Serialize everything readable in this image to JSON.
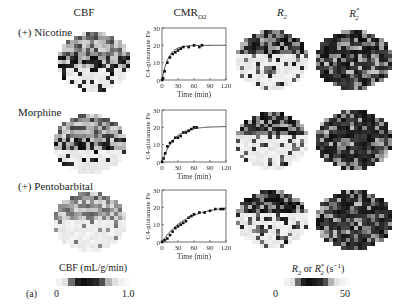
{
  "figure": {
    "panel_label": "(a)",
    "column_titles": {
      "cbf": "CBF",
      "cmro2_main": "CMR",
      "cmro2_sub": "O2",
      "r2_main": "R",
      "r2_sub": "2",
      "r2star_main": "R",
      "r2star_sub": "2",
      "r2star_sup": "*"
    },
    "rows": [
      {
        "label": "(+) Nicotine"
      },
      {
        "label": "Morphine"
      },
      {
        "label": "(+) Pentobarbital"
      }
    ],
    "plot_axis": {
      "ylabel": "C4-glutamate Fe",
      "xlabel": "Time (min)",
      "yticks": [
        "0",
        "10",
        "20",
        "30"
      ],
      "xticks": [
        "0",
        "30",
        "60",
        "90",
        "120"
      ]
    },
    "colorbars": {
      "cbf": {
        "title": "CBF (mL/g/min)",
        "min": "0",
        "max": "1.0"
      },
      "r2": {
        "title_main": "R",
        "title_sub": "2",
        "title_mid": " or ",
        "title_sup": "*",
        "title_unit": " (s",
        "title_exp": "−1",
        "title_end": ")",
        "min": "0",
        "max": "50"
      }
    }
  },
  "chart_data": [
    {
      "type": "scatter",
      "title": "(+) Nicotine CMRO2",
      "xlabel": "Time (min)",
      "ylabel": "C4-glutamate Fe",
      "xlim": [
        0,
        120
      ],
      "ylim": [
        0,
        30
      ],
      "x": [
        0,
        2,
        5,
        10,
        15,
        20,
        25,
        30,
        35,
        40,
        50,
        60,
        70,
        75
      ],
      "y": [
        0,
        1,
        5,
        10,
        13,
        15,
        16,
        17,
        18,
        19,
        19,
        20,
        19,
        20
      ],
      "fit": {
        "plateau": 20,
        "note": "exponential rise fit line"
      }
    },
    {
      "type": "scatter",
      "title": "Morphine CMRO2",
      "xlabel": "Time (min)",
      "ylabel": "C4-glutamate Fe",
      "xlim": [
        0,
        120
      ],
      "ylim": [
        0,
        30
      ],
      "x": [
        0,
        3,
        6,
        10,
        15,
        20,
        25,
        30,
        35,
        40,
        45,
        50,
        55,
        60,
        65
      ],
      "y": [
        0,
        2,
        5,
        9,
        11,
        12,
        14,
        14,
        15,
        17,
        17,
        18,
        19,
        20,
        20
      ],
      "fit": {
        "plateau": 20.5,
        "note": "exponential rise fit line"
      }
    },
    {
      "type": "scatter",
      "title": "(+) Pentobarbital CMRO2",
      "xlabel": "Time (min)",
      "ylabel": "C4-glutamate Fe",
      "xlim": [
        0,
        120
      ],
      "ylim": [
        0,
        30
      ],
      "x": [
        0,
        5,
        10,
        15,
        20,
        25,
        30,
        35,
        40,
        45,
        50,
        55,
        60,
        70,
        80,
        90,
        100,
        110,
        115
      ],
      "y": [
        0,
        1,
        2,
        4,
        6,
        8,
        9,
        10,
        11,
        12,
        14,
        15,
        16,
        17,
        17,
        18,
        19,
        19,
        19
      ],
      "fit": {
        "plateau": 21,
        "note": "slower exponential rise fit line"
      }
    }
  ]
}
